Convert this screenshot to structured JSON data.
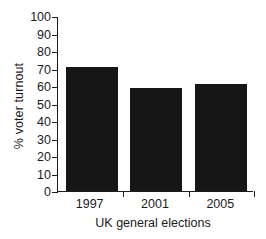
{
  "chart_data": {
    "type": "bar",
    "title": "",
    "categories": [
      "1997",
      "2001",
      "2005"
    ],
    "values": [
      71,
      59,
      61
    ],
    "series": [
      {
        "name": "% voter turnout",
        "values": [
          71,
          59,
          61
        ]
      }
    ],
    "xlabel": "UK general elections",
    "ylabel": "% voter turnout",
    "ylim": [
      0,
      100
    ],
    "ytick_labels": [
      "0",
      "10",
      "20",
      "30",
      "40",
      "50",
      "60",
      "70",
      "80",
      "90",
      "100"
    ],
    "ytick_values": [
      0,
      10,
      20,
      30,
      40,
      50,
      60,
      70,
      80,
      90,
      100
    ],
    "ytick_step": 10,
    "grid": false,
    "legend": false,
    "legend_position": "none",
    "bar_color": "#161616",
    "axis_color": "#1a1a1a",
    "background_color": "#ffffff"
  }
}
